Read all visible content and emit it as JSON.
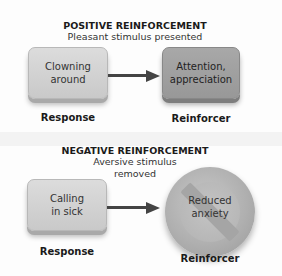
{
  "positive": {
    "title": "POSITIVE REINFORCEMENT",
    "subtitle": "Pleasant stimulus presented",
    "response_box": [
      "Clowning",
      "around"
    ],
    "reinforcer_box": [
      "Attention,",
      "appreciation"
    ],
    "response_label": "Response",
    "reinforcer_label": "Reinforcer"
  },
  "negative": {
    "title": "NEGATIVE REINFORCEMENT",
    "subtitle": [
      "Aversive stimulus",
      "removed"
    ],
    "response_box": [
      "Calling",
      "in sick"
    ],
    "reinforcer_circle": [
      "Reduced",
      "anxiety"
    ],
    "reinforcer_icon": "prohibition-sign-icon",
    "response_label": "Response",
    "reinforcer_label": "Reinforcer"
  },
  "colors": {
    "light_box": "#d2d2d2",
    "dark_box": "#a0a0a0",
    "arrow": "#444444"
  }
}
